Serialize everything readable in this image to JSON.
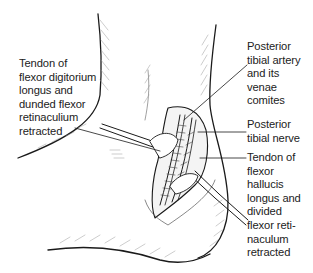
{
  "figure": {
    "labels": [
      {
        "id": "fdl",
        "text": "Tendon of\nflexor digitorium\nlongus and\ndunded flexor\nretinaculium\nretracted"
      },
      {
        "id": "pta",
        "text": "Posterior\ntibial artery\nand its\nvenae\ncomites"
      },
      {
        "id": "ptn",
        "text": "Posterior\ntibial nerve"
      },
      {
        "id": "fhl",
        "text": "Tendon of\nflexor\nhallucis\nlongus and\ndivided\nflexor reti-\nnaculum\nretracted"
      }
    ],
    "colors": {
      "line": "#1a1a1a",
      "hatch": "#9a9a9a",
      "background": "#ffffff"
    }
  }
}
